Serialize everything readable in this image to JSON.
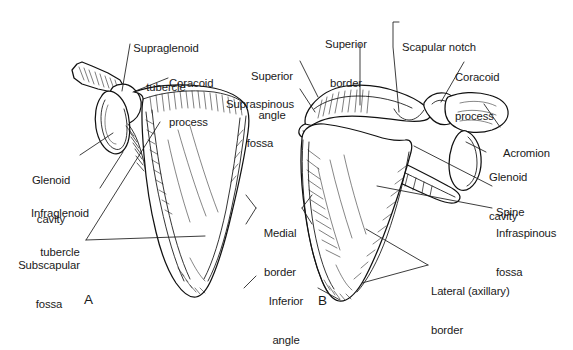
{
  "figure": {
    "background_color": "#ffffff",
    "ink_color": "#1a1a1a",
    "panels": [
      {
        "letter": "A",
        "view": "anterior",
        "x": 84,
        "y": 299
      },
      {
        "letter": "B",
        "view": "posterior",
        "x": 318,
        "y": 300
      }
    ]
  },
  "labels": {
    "supraglenoid_tubercle": {
      "line1": "Supraglenoid",
      "line2": "tubercle"
    },
    "coracoid_process_a": {
      "line1": "Coracoid",
      "line2": "process"
    },
    "glenoid_cavity_a": {
      "line1": "Glenoid",
      "line2": "cavity"
    },
    "infraglenoid_tubercle": {
      "line1": "Infraglenoid",
      "line2": "tubercle"
    },
    "subscapular_fossa": {
      "line1": "Subscapular",
      "line2": "fossa"
    },
    "superior_angle": {
      "line1": "Superior",
      "line2": "angle"
    },
    "supraspinous_fossa": {
      "line1": "Supraspinous",
      "line2": "fossa"
    },
    "superior_border": {
      "line1": "Superior",
      "line2": "border"
    },
    "scapular_notch": {
      "line1": "Scapular notch"
    },
    "coracoid_process_b": {
      "line1": "Coracoid",
      "line2": "process"
    },
    "acromion": {
      "line1": "Acromion"
    },
    "glenoid_cavity_b": {
      "line1": "Glenoid",
      "line2": "cavity"
    },
    "spine": {
      "line1": "Spine"
    },
    "infraspinous_fossa": {
      "line1": "Infraspinous",
      "line2": "fossa"
    },
    "lateral_axillary_border": {
      "line1": "Lateral (axillary)",
      "line2": "border"
    },
    "medial_border": {
      "line1": "Medial",
      "line2": "border"
    },
    "inferior_angle": {
      "line1": "Inferior",
      "line2": "angle"
    }
  }
}
